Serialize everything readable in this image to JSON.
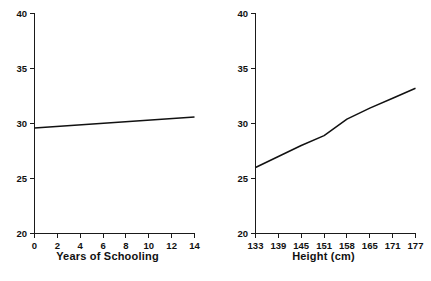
{
  "figure": {
    "background_color": "#ffffff",
    "line_color": "#111111",
    "axis_color": "#1a1a1a"
  },
  "chart_data": [
    {
      "type": "line",
      "panel": "left",
      "title": "",
      "xlabel": "Years of Schooling",
      "ylabel": "",
      "xlim": [
        0,
        14
      ],
      "ylim": [
        20,
        40
      ],
      "xticks": [
        0,
        2,
        4,
        6,
        8,
        10,
        12,
        14
      ],
      "xtick_labels": [
        "0",
        "2",
        "4",
        "6",
        "8",
        "10",
        "12",
        "14"
      ],
      "yticks": [
        20,
        25,
        30,
        35,
        40
      ],
      "ytick_labels": [
        "20",
        "25",
        "30",
        "35",
        "40"
      ],
      "grid": false,
      "legend": "none",
      "series": [
        {
          "name": "",
          "x": [
            0,
            14
          ],
          "values": [
            29.6,
            30.6
          ]
        }
      ]
    },
    {
      "type": "line",
      "panel": "right",
      "title": "",
      "xlabel": "Height (cm)",
      "ylabel": "",
      "xlim": [
        133,
        177
      ],
      "ylim": [
        20,
        40
      ],
      "xticks": [
        133,
        139,
        145,
        151,
        158,
        165,
        171,
        177
      ],
      "xtick_labels": [
        "133",
        "139",
        "145",
        "151",
        "158",
        "165",
        "171",
        "177"
      ],
      "yticks": [
        20,
        25,
        30,
        35,
        40
      ],
      "ytick_labels": [
        "20",
        "25",
        "30",
        "35",
        "40"
      ],
      "grid": false,
      "legend": "none",
      "series": [
        {
          "name": "",
          "x": [
            133,
            139,
            145,
            151,
            158,
            165,
            171,
            177
          ],
          "values": [
            26.0,
            27.0,
            28.0,
            28.9,
            30.4,
            31.4,
            32.3,
            33.2
          ]
        }
      ]
    }
  ]
}
